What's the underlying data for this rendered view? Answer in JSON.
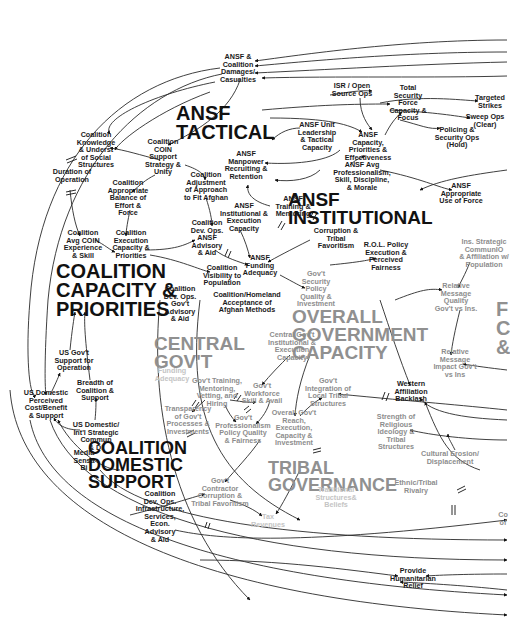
{
  "diagram": {
    "type": "causal-loop-diagram",
    "sectors": [
      {
        "id": "ansf_tactical",
        "label": "ANSF\nTACTICAL",
        "x": 186,
        "y": 95,
        "size": 20,
        "tone": "dark"
      },
      {
        "id": "ansf_institutional",
        "label": "ANSF\nINSTITUTIONAL",
        "x": 318,
        "y": 190,
        "size": 19,
        "tone": "dark"
      },
      {
        "id": "coalition_capacity",
        "label": "COALITION\nCAPACITY &\nPRIORITIES",
        "x": 55,
        "y": 262,
        "size": 20,
        "tone": "dark"
      },
      {
        "id": "central_govt",
        "label": "CENTRAL\nGOV'T",
        "x": 155,
        "y": 336,
        "size": 19,
        "tone": "grey"
      },
      {
        "id": "overall_govt",
        "label": "OVERALL\nGOVERNMENT\nCAPACITY",
        "x": 292,
        "y": 309,
        "size": 19,
        "tone": "grey"
      },
      {
        "id": "coalition_domestic",
        "label": "COALITION\nDOMESTIC\nSUPPORT",
        "x": 89,
        "y": 440,
        "size": 18,
        "tone": "dark"
      },
      {
        "id": "tribal_governance",
        "label": "TRIBAL\nGOVERNANCE",
        "x": 268,
        "y": 460,
        "size": 18,
        "tone": "grey"
      },
      {
        "id": "partial_right",
        "label": "F\nC\n&",
        "x": 496,
        "y": 300,
        "size": 20,
        "tone": "grey"
      }
    ],
    "nodes": [
      {
        "id": "n1",
        "label": "ANSF &\nCoalition\nDamages/\nCasualties",
        "x": 236,
        "y": 68,
        "tone": "dark"
      },
      {
        "id": "n2",
        "label": "ISR / Open\nSource Ops",
        "x": 359,
        "y": 90,
        "tone": "dark"
      },
      {
        "id": "n3",
        "label": "Total\nSecurity\nForce\nCapacity &\nFocus",
        "x": 408,
        "y": 102,
        "tone": "dark"
      },
      {
        "id": "n4",
        "label": "Targeted\nStrikes",
        "x": 488,
        "y": 102,
        "tone": "dark"
      },
      {
        "id": "n5",
        "label": "Sweep Ops\n(Clear)",
        "x": 483,
        "y": 121,
        "tone": "dark"
      },
      {
        "id": "n6",
        "label": "Policing &\nSecurity Ops\n(Hold)",
        "x": 457,
        "y": 136,
        "tone": "dark"
      },
      {
        "id": "n7",
        "label": "ANSF Unit\nLeadership\n& Tactical\nCapacity",
        "x": 319,
        "y": 136,
        "tone": "dark"
      },
      {
        "id": "n8",
        "label": "ANSF\nCapacity,\nPriorities &\nEffectiveness",
        "x": 370,
        "y": 146,
        "tone": "dark"
      },
      {
        "id": "n9",
        "label": "Coalition\nKnowledge\n& Underst\nof Social\nStructures",
        "x": 96,
        "y": 148,
        "tone": "dark"
      },
      {
        "id": "n10",
        "label": "Coalition\nCOIN\nSupport\nStrategy &\nUnity",
        "x": 170,
        "y": 160,
        "tone": "dark"
      },
      {
        "id": "n11",
        "label": "ANSF\nManpower\nRecruiting &\nRetention",
        "x": 246,
        "y": 165,
        "tone": "dark"
      },
      {
        "id": "n12",
        "label": "Duration of\nOperation",
        "x": 72,
        "y": 175,
        "tone": "dark"
      },
      {
        "id": "n13",
        "label": "Coalition\nAdjustment\nof Approach\nto Fit Afghan",
        "x": 206,
        "y": 186,
        "tone": "dark"
      },
      {
        "id": "n14",
        "label": "ANSF Avg\nProfessionalism,\nSkill, Discipline,\n& Morale",
        "x": 360,
        "y": 176,
        "tone": "dark"
      },
      {
        "id": "n15",
        "label": "Coalition\nAppropriate\nBalance of\nEffort &\nForce",
        "x": 130,
        "y": 196,
        "tone": "dark"
      },
      {
        "id": "n16",
        "label": "ANSF\nAppropriate\nUse of Force",
        "x": 461,
        "y": 193,
        "tone": "dark"
      },
      {
        "id": "n17",
        "label": "ANSF\nTraining &\nMentoring",
        "x": 295,
        "y": 206,
        "tone": "dark"
      },
      {
        "id": "n18",
        "label": "ANSF\nInstitutional &\nExecution\nCapacity",
        "x": 246,
        "y": 216,
        "tone": "dark"
      },
      {
        "id": "n19",
        "label": "Coalition\nDev. Ops.\nANSF\nAdvisory\n& Aid",
        "x": 207,
        "y": 237,
        "tone": "dark"
      },
      {
        "id": "n20",
        "label": "Coalition\nAvg COIN\nExperience\n& Skill",
        "x": 83,
        "y": 242,
        "tone": "dark"
      },
      {
        "id": "n21",
        "label": "Coalition\nExecution\nCapacity &\nPriorities",
        "x": 126,
        "y": 245,
        "tone": "dark"
      },
      {
        "id": "n22",
        "label": "Corruption &\nTribal\nFavoritism",
        "x": 340,
        "y": 240,
        "tone": "dark"
      },
      {
        "id": "n23",
        "label": "Ins. Strategic\nCommunIO\n& Affiliation w/\nPopulation",
        "x": 481,
        "y": 253,
        "tone": "grey"
      },
      {
        "id": "n24",
        "label": "R.O.L. Policy\nExecution &\nPerceived\nFairness",
        "x": 386,
        "y": 256,
        "tone": "dark"
      },
      {
        "id": "n25",
        "label": "ANSF\nFunding\nAdequacy",
        "x": 258,
        "y": 265,
        "tone": "dark"
      },
      {
        "id": "n26",
        "label": "Coalition\nVisibility to\nPopulation",
        "x": 220,
        "y": 275,
        "tone": "dark"
      },
      {
        "id": "n27",
        "label": "Gov't\nSecurity\nPolicy\nQuality &\nInvestment",
        "x": 315,
        "y": 288,
        "tone": "grey"
      },
      {
        "id": "n28",
        "label": "Coalition\nDev. Ops.\nGov't\nAdvisory\n& Aid",
        "x": 178,
        "y": 305,
        "tone": "dark"
      },
      {
        "id": "n29",
        "label": "Coalition/Homeland\nAcceptance of\nAfghan Methods",
        "x": 247,
        "y": 302,
        "tone": "dark"
      },
      {
        "id": "n30",
        "label": "Relative\nMessage\nQuality\nGov't vs Ins.",
        "x": 456,
        "y": 296,
        "tone": "grey"
      },
      {
        "id": "n31",
        "label": "US Gov't\nSupport for\nOperation",
        "x": 62,
        "y": 360,
        "tone": "dark"
      },
      {
        "id": "n32",
        "label": "Central Gov't\nInstitutional &\nExecution\nCapacity",
        "x": 284,
        "y": 345,
        "tone": "grey"
      },
      {
        "id": "n33",
        "label": "Relative\nMessage\nImpact Gov't\nvs Ins",
        "x": 451,
        "y": 363,
        "tone": "grey"
      },
      {
        "id": "n34",
        "label": "Funding\nAdequacy",
        "x": 173,
        "y": 375,
        "tone": "grey"
      },
      {
        "id": "n35",
        "label": "Breadth of\nCoalition &\nSupport",
        "x": 94,
        "y": 389,
        "tone": "dark"
      },
      {
        "id": "n36",
        "label": "Gov't Training,\nMentoring,\nVetting, and\nHiring",
        "x": 218,
        "y": 392,
        "tone": "grey"
      },
      {
        "id": "n37",
        "label": "Gov't\nWorkforce\nSkill & Avail",
        "x": 260,
        "y": 393,
        "tone": "grey"
      },
      {
        "id": "n38",
        "label": "Gov't\nIntegration of\nLocal Tribal\nStructures",
        "x": 328,
        "y": 392,
        "tone": "grey"
      },
      {
        "id": "n39",
        "label": "Western\nAffiliation\nBacklash",
        "x": 412,
        "y": 391,
        "tone": "dark"
      },
      {
        "id": "n40",
        "label": "US Domestic\nPerceived\nCost/Benefit\n& Support",
        "x": 44,
        "y": 404,
        "tone": "dark"
      },
      {
        "id": "n41",
        "label": "Transparency\nof Gov't\nProcesses &\nInvestments",
        "x": 185,
        "y": 418,
        "tone": "grey"
      },
      {
        "id": "n42",
        "label": "Gov't\nProfessionalism\nPolicy Quality\n& Fairness",
        "x": 242,
        "y": 428,
        "tone": "grey"
      },
      {
        "id": "n43",
        "label": "Overall Gov't\nReach,\nExecution,\nCapacity &\nInvestment",
        "x": 294,
        "y": 425,
        "tone": "grey"
      },
      {
        "id": "n44",
        "label": "Strength of\nReligious\nIdeology &\nTribal\nStructures",
        "x": 397,
        "y": 430,
        "tone": "grey"
      },
      {
        "id": "n45",
        "label": "US Domestic/\nInt'l Strategic\nCommun\n& Di",
        "x": 94,
        "y": 436,
        "tone": "dark"
      },
      {
        "id": "n46",
        "label": "Cultural Erosion/\nDisplacement",
        "x": 449,
        "y": 457,
        "tone": "grey"
      },
      {
        "id": "n47",
        "label": "Media\nSensa\nBi",
        "x": 85,
        "y": 460,
        "tone": "dark"
      },
      {
        "id": "n48",
        "label": "Gov't\nContractor\nCorruption &\nTribal Favoritism",
        "x": 219,
        "y": 490,
        "tone": "grey"
      },
      {
        "id": "n49",
        "label": "Ethnic/Tribal\nRivalry",
        "x": 410,
        "y": 487,
        "tone": "grey"
      },
      {
        "id": "n50",
        "label": "Traditional\nStructures&\nBeliefs",
        "x": 338,
        "y": 497,
        "tone": "grey"
      },
      {
        "id": "n51",
        "label": "Coalition\nDev. Ops.\nInfrastructure,\nServices,\nEcon.\nAdvisory\n& Aid",
        "x": 157,
        "y": 517,
        "tone": "dark"
      },
      {
        "id": "n52",
        "label": "Tax\nRevenues",
        "x": 270,
        "y": 521,
        "tone": "faint"
      },
      {
        "id": "n53",
        "label": "Co\nof",
        "x": 502,
        "y": 519,
        "tone": "grey"
      },
      {
        "id": "n54",
        "label": "Provide\nHumanitarian\nRelief",
        "x": 413,
        "y": 578,
        "tone": "dark"
      }
    ]
  }
}
